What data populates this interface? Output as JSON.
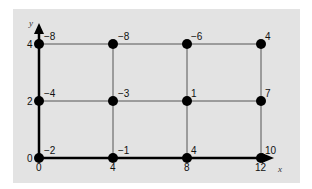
{
  "diagram": {
    "axes": {
      "x_label": "x",
      "y_label": "y"
    },
    "x_ticks": [
      "0",
      "4",
      "8",
      "12"
    ],
    "y_ticks": [
      "0",
      "2",
      "4"
    ],
    "grid": {
      "x_values": [
        0,
        4,
        8,
        12
      ],
      "y_values": [
        0,
        2,
        4
      ]
    },
    "nodes": [
      {
        "x": 0,
        "y": 4,
        "value": "−8"
      },
      {
        "x": 4,
        "y": 4,
        "value": "−8"
      },
      {
        "x": 8,
        "y": 4,
        "value": "−6"
      },
      {
        "x": 12,
        "y": 4,
        "value": "4"
      },
      {
        "x": 0,
        "y": 2,
        "value": "−4"
      },
      {
        "x": 4,
        "y": 2,
        "value": "−3"
      },
      {
        "x": 8,
        "y": 2,
        "value": "1"
      },
      {
        "x": 12,
        "y": 2,
        "value": "7"
      },
      {
        "x": 0,
        "y": 0,
        "value": "−2"
      },
      {
        "x": 4,
        "y": 0,
        "value": "−1"
      },
      {
        "x": 8,
        "y": 0,
        "value": "4"
      },
      {
        "x": 12,
        "y": 0,
        "value": "10"
      }
    ],
    "colors": {
      "panel": "#e3e3e3",
      "lines": "#555555",
      "axis": "#000000",
      "nodes": "#000000"
    }
  }
}
